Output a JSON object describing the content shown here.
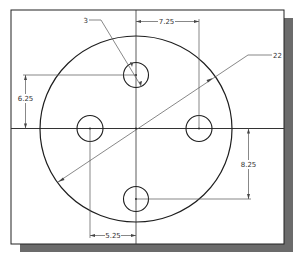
{
  "drawing": {
    "title": "Plate with four holes - dimensioned sketch",
    "colors": {
      "background": "#ffffff",
      "frame": "#222222",
      "shadow": "#6b6b6b",
      "geometry": "#1e1e1e",
      "dimension": "#555555"
    },
    "dimensions": {
      "hole_diameter": "3",
      "plate_diameter": "22",
      "top_hole_offset_x": "7.25",
      "top_hole_offset_y": "6.25",
      "bottom_hole_offset_y": "8.25",
      "left_hole_offset_x": "5.25"
    }
  }
}
